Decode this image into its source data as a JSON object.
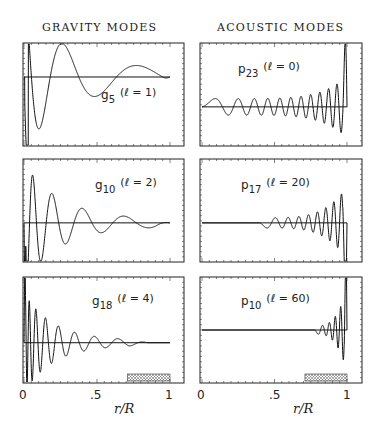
{
  "titles": {
    "left": "GRAVITY MODES",
    "right": "ACOUSTIC MODES"
  },
  "axis": {
    "xlabel": "r/R",
    "xticks": [
      "0",
      ".5",
      "1"
    ]
  },
  "panels": [
    {
      "id": "g5",
      "mode": "g",
      "n": "5",
      "ell": "1",
      "label_main": "g",
      "label_sub": "5",
      "label_par": "(ℓ = 1)"
    },
    {
      "id": "p23",
      "mode": "p",
      "n": "23",
      "ell": "0",
      "label_main": "p",
      "label_sub": "23",
      "label_par": "(ℓ = 0)"
    },
    {
      "id": "g10",
      "mode": "g",
      "n": "10",
      "ell": "2",
      "label_main": "g",
      "label_sub": "10",
      "label_par": "(ℓ = 2)"
    },
    {
      "id": "p17",
      "mode": "p",
      "n": "17",
      "ell": "20",
      "label_main": "p",
      "label_sub": "17",
      "label_par": "(ℓ = 20)"
    },
    {
      "id": "g18",
      "mode": "g",
      "n": "18",
      "ell": "4",
      "label_main": "g",
      "label_sub": "18",
      "label_par": "(ℓ = 4)"
    },
    {
      "id": "p10",
      "mode": "p",
      "n": "10",
      "ell": "60",
      "label_main": "p",
      "label_sub": "10",
      "label_par": "(ℓ = 60)"
    }
  ],
  "chart_data": [
    {
      "type": "line",
      "title": "g5 (ℓ = 1)",
      "column": "GRAVITY MODES",
      "xlabel": "r/R",
      "xlim": [
        0,
        1
      ],
      "description": "Eigenfunction with ~5 nodes, large oscillations concentrated near the core (r<0.3), broad low-amplitude lobe out to r≈1",
      "nodes_approx": 5,
      "shaded_region": null
    },
    {
      "type": "line",
      "title": "p23 (ℓ = 0)",
      "column": "ACOUSTIC MODES",
      "xlabel": "r/R",
      "xlim": [
        0,
        1
      ],
      "description": "Radial mode with ~23 nodes spanning the whole star; amplitude grows and wavelength shortens toward the surface",
      "nodes_approx": 23,
      "shaded_region": null
    },
    {
      "type": "line",
      "title": "g10 (ℓ = 2)",
      "column": "GRAVITY MODES",
      "xlabel": "r/R",
      "xlim": [
        0,
        1
      ],
      "description": "Oscillations confined to the radiative interior, decaying outward; ~10 nodes",
      "nodes_approx": 10,
      "shaded_region": null
    },
    {
      "type": "line",
      "title": "p17 (ℓ = 20)",
      "column": "ACOUSTIC MODES",
      "xlabel": "r/R",
      "xlim": [
        0,
        1
      ],
      "description": "Oscillation begins near r≈0.4 (inner turning point), amplitude grows toward surface",
      "nodes_approx": 17,
      "shaded_region": null
    },
    {
      "type": "line",
      "title": "g18 (ℓ = 4)",
      "column": "GRAVITY MODES",
      "xlabel": "r/R",
      "xlim": [
        0,
        1
      ],
      "description": "Densely packed oscillations near centre, decaying by r≈0.7",
      "nodes_approx": 18,
      "shaded_region": {
        "x0": 0.71,
        "x1": 1.0,
        "label": "convection zone"
      }
    },
    {
      "type": "line",
      "title": "p10 (ℓ = 60)",
      "column": "ACOUSTIC MODES",
      "xlabel": "r/R",
      "xlim": [
        0,
        1
      ],
      "description": "Flat until r≈0.8, then rapid oscillations confined near the surface",
      "nodes_approx": 10,
      "shaded_region": {
        "x0": 0.71,
        "x1": 1.0,
        "label": "convection zone"
      }
    }
  ]
}
